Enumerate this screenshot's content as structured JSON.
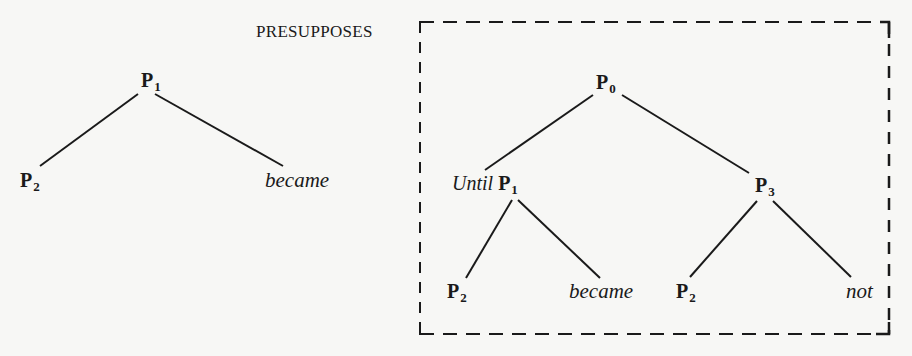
{
  "diagram": {
    "relation_label": "PRESUPPOSES",
    "left_tree": {
      "root": {
        "symbol": "P",
        "subscript": "1"
      },
      "children": [
        {
          "symbol": "P",
          "subscript": "2"
        },
        {
          "word": "became"
        }
      ]
    },
    "right_tree": {
      "root": {
        "symbol": "P",
        "subscript": "0"
      },
      "left_child": {
        "prefix_word": "Until",
        "symbol": "P",
        "subscript": "1",
        "children": [
          {
            "symbol": "P",
            "subscript": "2"
          },
          {
            "word": "became"
          }
        ]
      },
      "right_child": {
        "symbol": "P",
        "subscript": "3",
        "children": [
          {
            "symbol": "P",
            "subscript": "2"
          },
          {
            "word": "not"
          }
        ]
      }
    },
    "colors": {
      "ink": "#1a1a1a",
      "background": "#f7f7f5"
    }
  }
}
